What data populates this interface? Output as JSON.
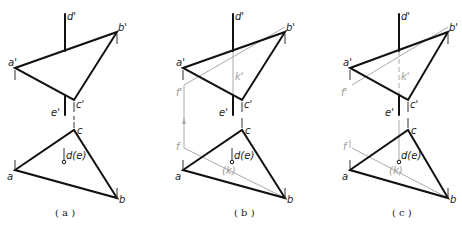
{
  "figure": {
    "panels": [
      {
        "id": "a",
        "caption": "( a )",
        "labels": {
          "d_prime": "d'",
          "b_prime": "b'",
          "a_prime": "a'",
          "c_prime": "c'",
          "e_prime": "e'",
          "c": "c",
          "de": "d(e)",
          "a": "a",
          "b": "b"
        }
      },
      {
        "id": "b",
        "caption": "( b )",
        "labels": {
          "d_prime": "d'",
          "b_prime": "b'",
          "a_prime": "a'",
          "c_prime": "c'",
          "e_prime": "e'",
          "k_prime": "k'",
          "f_prime": "f'",
          "c": "c",
          "de": "d(e)",
          "a": "a",
          "b": "b",
          "f": "f",
          "k": "(k)"
        }
      },
      {
        "id": "c",
        "caption": "( c )",
        "labels": {
          "d_prime": "d'",
          "b_prime": "b'",
          "a_prime": "a'",
          "c_prime": "c'",
          "e_prime": "e'",
          "k_prime": "k'",
          "f_prime": "f'",
          "c": "c",
          "de": "d(e)",
          "a": "a",
          "b": "b",
          "f": "f",
          "k": "(k)"
        }
      }
    ],
    "colors": {
      "visible_line": "#111111",
      "construction_line": "#aaaaaa"
    }
  }
}
